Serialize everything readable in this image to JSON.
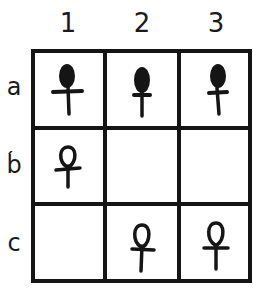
{
  "columns": [
    {
      "label": "1"
    },
    {
      "label": "2"
    },
    {
      "label": "3"
    }
  ],
  "rows": [
    {
      "label": "a"
    },
    {
      "label": "b́"
    },
    {
      "label": "c"
    }
  ],
  "cells": {
    "a1": {
      "symbol": "ankh-filled-wide-bar"
    },
    "a2": {
      "symbol": "ankh-filled-narrow-bar"
    },
    "a3": {
      "symbol": "ankh-filled-narrow-bar"
    },
    "b1": {
      "symbol": "ankh-outline"
    },
    "b2": {
      "symbol": "empty"
    },
    "b3": {
      "symbol": "empty"
    },
    "c1": {
      "symbol": "empty"
    },
    "c2": {
      "symbol": "ankh-outline"
    },
    "c3": {
      "symbol": "ankh-outline"
    }
  },
  "colors": {
    "ink": "#151515",
    "background": "#ffffff"
  }
}
